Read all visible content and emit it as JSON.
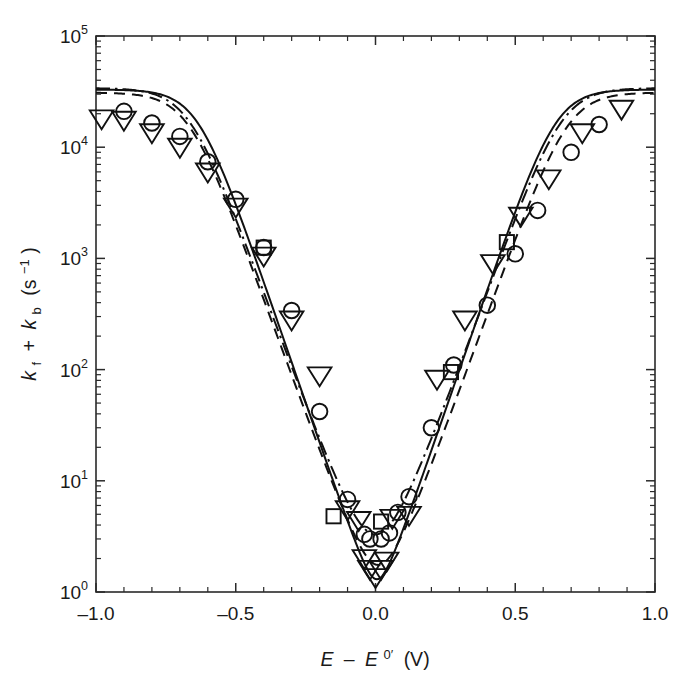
{
  "figure": {
    "background": "#ffffff",
    "ink_color": "#111111"
  },
  "chart_data": {
    "type": "scatter",
    "title": "",
    "subtitle": "",
    "xlabel": "E − E⁰′ (V)",
    "xlabel_parts": {
      "e1": "E",
      "minus": "–",
      "e2": "E",
      "sup": "0′",
      "unit": "(V)"
    },
    "ylabel": "kᶠ + kʙ (s⁻¹)",
    "ylabel_parts": {
      "kf": "k",
      "kf_sub": "f",
      "plus": "+",
      "kb": "k",
      "kb_sub": "b",
      "unit_open": "(s",
      "unit_sup": "−1",
      "unit_close": ")"
    },
    "xscale": "linear",
    "yscale": "log",
    "xlim": [
      -1.0,
      1.0
    ],
    "ylim": [
      1,
      100000
    ],
    "grid": false,
    "legend": "none",
    "xticks": [
      -1.0,
      -0.5,
      0.0,
      0.5,
      1.0
    ],
    "xticklabels": [
      "–1.0",
      "–0.5",
      "0.0",
      "0.5",
      "1.0"
    ],
    "x_minor_tick_step": 0.1,
    "yticks": [
      1,
      10,
      100,
      1000,
      10000,
      100000
    ],
    "yticklabels": [
      "10⁰",
      "10¹",
      "10²",
      "10³",
      "10⁴",
      "10⁵"
    ],
    "ytick_mantissa": "10",
    "ytick_exponents": [
      "0",
      "1",
      "2",
      "3",
      "4",
      "5"
    ],
    "tick_direction": "in",
    "series": [
      {
        "name": "circle-data",
        "marker": "circle",
        "points": [
          {
            "x": -0.9,
            "y": 21000
          },
          {
            "x": -0.8,
            "y": 16500
          },
          {
            "x": -0.7,
            "y": 12500
          },
          {
            "x": -0.6,
            "y": 7400
          },
          {
            "x": -0.5,
            "y": 3400
          },
          {
            "x": -0.4,
            "y": 1250
          },
          {
            "x": -0.3,
            "y": 340
          },
          {
            "x": -0.2,
            "y": 42
          },
          {
            "x": -0.1,
            "y": 6.8
          },
          {
            "x": -0.04,
            "y": 3.3
          },
          {
            "x": -0.02,
            "y": 3.0
          },
          {
            "x": 0.02,
            "y": 3.0
          },
          {
            "x": 0.05,
            "y": 3.4
          },
          {
            "x": 0.08,
            "y": 5.2
          },
          {
            "x": 0.12,
            "y": 7.2
          },
          {
            "x": 0.2,
            "y": 30
          },
          {
            "x": 0.28,
            "y": 110
          },
          {
            "x": 0.4,
            "y": 380
          },
          {
            "x": 0.5,
            "y": 1100
          },
          {
            "x": 0.58,
            "y": 2700
          },
          {
            "x": 0.7,
            "y": 9000
          },
          {
            "x": 0.8,
            "y": 16000
          }
        ]
      },
      {
        "name": "triangle-data",
        "marker": "triangle-down",
        "points": [
          {
            "x": -0.98,
            "y": 18000
          },
          {
            "x": -0.9,
            "y": 17500
          },
          {
            "x": -0.8,
            "y": 13500
          },
          {
            "x": -0.7,
            "y": 10000
          },
          {
            "x": -0.6,
            "y": 6000
          },
          {
            "x": -0.5,
            "y": 2900
          },
          {
            "x": -0.4,
            "y": 1050
          },
          {
            "x": -0.3,
            "y": 280
          },
          {
            "x": -0.2,
            "y": 88
          },
          {
            "x": -0.1,
            "y": 5.5
          },
          {
            "x": -0.06,
            "y": 4.4
          },
          {
            "x": -0.04,
            "y": 2.0
          },
          {
            "x": -0.02,
            "y": 1.6
          },
          {
            "x": 0.0,
            "y": 1.35
          },
          {
            "x": 0.02,
            "y": 1.6
          },
          {
            "x": 0.04,
            "y": 1.9
          },
          {
            "x": 0.06,
            "y": 4.6
          },
          {
            "x": 0.12,
            "y": 4.9
          },
          {
            "x": 0.22,
            "y": 82
          },
          {
            "x": 0.32,
            "y": 280
          },
          {
            "x": 0.42,
            "y": 900
          },
          {
            "x": 0.52,
            "y": 2400
          },
          {
            "x": 0.62,
            "y": 5200
          },
          {
            "x": 0.74,
            "y": 13500
          },
          {
            "x": 0.88,
            "y": 22000
          }
        ]
      },
      {
        "name": "square-data",
        "marker": "square",
        "points": [
          {
            "x": -0.4,
            "y": 1250
          },
          {
            "x": -0.15,
            "y": 4.8
          },
          {
            "x": 0.02,
            "y": 4.3
          },
          {
            "x": 0.27,
            "y": 95
          },
          {
            "x": 0.47,
            "y": 1400
          }
        ]
      }
    ],
    "curves": [
      {
        "name": "solid-fit",
        "style": "solid",
        "description": "Marcus-type V-shaped theoretical curve, lowest minimum"
      },
      {
        "name": "dashed-fit",
        "style": "dashed",
        "description": "Marcus-type V-shaped theoretical curve, broader minimum"
      },
      {
        "name": "dashdot-fit",
        "style": "dash-dot",
        "description": "Marcus-type V-shaped theoretical curve, highest minimum"
      }
    ]
  }
}
